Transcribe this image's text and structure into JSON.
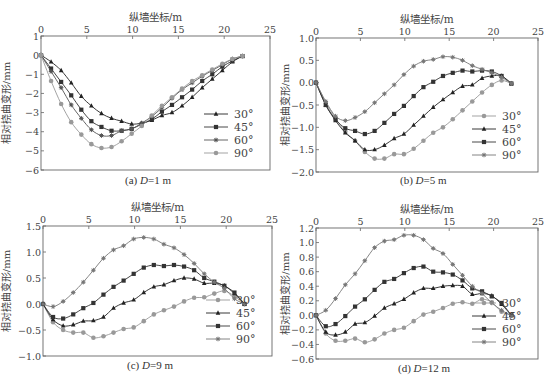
{
  "colors": {
    "s30_dark": "#222222",
    "s45_dark": "#333333",
    "s60_dark": "#444444",
    "s90_light": "#999999",
    "axis": "#555555"
  },
  "chart_data": [
    {
      "id": "a",
      "type": "line",
      "title": "(a) D=1 m",
      "caption_prefix": "(a) ",
      "caption_var": "D",
      "caption_suffix": "=1 m",
      "xlabel": "纵墙坐标/m",
      "ylabel": "相对挠曲变形/mm",
      "xlim": [
        0,
        25
      ],
      "ylim": [
        -6,
        1
      ],
      "xticks": [
        0,
        5,
        10,
        15,
        20,
        25
      ],
      "yticks": [
        1,
        0,
        -1,
        -2,
        -3,
        -4,
        -5,
        -6
      ],
      "ytick_labels": [
        "1",
        "0",
        "−1",
        "−2",
        "−3",
        "−4",
        "−5",
        "−6"
      ],
      "xaxis_position": "top",
      "grid": false,
      "legend_position": "lower right",
      "plot_box": {
        "left": 41,
        "top": 36,
        "right": 270,
        "bottom": 170
      },
      "x": [
        0,
        1.1,
        2.2,
        3.3,
        4.4,
        5.5,
        6.6,
        7.7,
        8.8,
        9.9,
        11,
        12.1,
        13.2,
        14.3,
        15.4,
        16.5,
        17.6,
        18.7,
        19.8,
        20.9,
        22
      ],
      "series": [
        {
          "name": "30°",
          "marker": "triangle",
          "color": "#222222",
          "values": [
            0,
            -0.35,
            -0.8,
            -1.45,
            -2.15,
            -2.65,
            -3.05,
            -3.3,
            -3.45,
            -3.6,
            -3.55,
            -3.4,
            -3.15,
            -3.0,
            -2.65,
            -2.2,
            -1.7,
            -1.25,
            -0.8,
            -0.35,
            -0.05
          ]
        },
        {
          "name": "45°",
          "marker": "square",
          "color": "#333333",
          "values": [
            0,
            -0.7,
            -1.4,
            -2.1,
            -2.85,
            -3.45,
            -3.75,
            -3.95,
            -3.95,
            -3.85,
            -3.6,
            -3.35,
            -2.95,
            -2.6,
            -2.2,
            -1.8,
            -1.35,
            -1.0,
            -0.6,
            -0.3,
            -0.05
          ]
        },
        {
          "name": "60°",
          "marker": "star",
          "color": "#555555",
          "values": [
            0,
            -0.85,
            -1.7,
            -2.6,
            -3.3,
            -3.9,
            -4.2,
            -4.2,
            -3.95,
            -3.85,
            -3.55,
            -3.2,
            -2.75,
            -2.25,
            -1.8,
            -1.45,
            -1.1,
            -0.8,
            -0.5,
            -0.2,
            -0.05
          ]
        },
        {
          "name": "90°",
          "marker": "circle",
          "color": "#999999",
          "values": [
            0,
            -1.35,
            -2.55,
            -3.5,
            -4.15,
            -4.65,
            -4.85,
            -4.8,
            -4.5,
            -4.1,
            -3.7,
            -3.15,
            -2.65,
            -2.2,
            -1.75,
            -1.35,
            -1.05,
            -0.75,
            -0.45,
            -0.2,
            -0.05
          ]
        }
      ]
    },
    {
      "id": "b",
      "type": "line",
      "title": "(b) D=5 m",
      "caption_prefix": "(b) ",
      "caption_var": "D",
      "caption_suffix": "=5 m",
      "xlabel": "纵墙坐标/m",
      "ylabel": "相对挠曲变形/mm",
      "xlim": [
        0,
        25
      ],
      "ylim": [
        -2.0,
        1.0
      ],
      "xticks": [
        0,
        5,
        10,
        15,
        20,
        25
      ],
      "yticks": [
        1.0,
        0.5,
        0.0,
        -0.5,
        -1.0,
        -1.5,
        -2.0
      ],
      "ytick_labels": [
        "1.0",
        "0.5",
        "0.0",
        "−0.5",
        "−1.0",
        "−1.5",
        "−2.0"
      ],
      "xaxis_position": "top",
      "grid": false,
      "legend_position": "lower right",
      "plot_box": {
        "left": 316,
        "top": 38,
        "right": 538,
        "bottom": 172
      },
      "x": [
        0,
        1.1,
        2.2,
        3.3,
        4.4,
        5.5,
        6.6,
        7.7,
        8.8,
        9.9,
        11,
        12.1,
        13.2,
        14.3,
        15.4,
        16.5,
        17.6,
        18.7,
        19.8,
        20.9,
        22
      ],
      "series": [
        {
          "name": "30°",
          "marker": "circle",
          "color": "#999999",
          "values": [
            0,
            -0.45,
            -0.8,
            -1.1,
            -1.3,
            -1.55,
            -1.7,
            -1.7,
            -1.6,
            -1.6,
            -1.48,
            -1.3,
            -1.12,
            -1.0,
            -0.82,
            -0.62,
            -0.42,
            -0.22,
            -0.05,
            0.05,
            -0.02
          ]
        },
        {
          "name": "45°",
          "marker": "triangle",
          "color": "#222222",
          "values": [
            0,
            -0.5,
            -0.85,
            -1.12,
            -1.3,
            -1.5,
            -1.5,
            -1.4,
            -1.25,
            -1.15,
            -0.95,
            -0.75,
            -0.55,
            -0.38,
            -0.22,
            -0.08,
            -0.05,
            0.1,
            0.15,
            0.15,
            -0.02
          ]
        },
        {
          "name": "60°",
          "marker": "square",
          "color": "#333333",
          "values": [
            0,
            -0.5,
            -0.82,
            -1.02,
            -1.08,
            -1.15,
            -1.08,
            -0.9,
            -0.7,
            -0.52,
            -0.3,
            -0.1,
            0.02,
            0.15,
            0.22,
            0.27,
            0.25,
            0.27,
            0.25,
            0.15,
            -0.02
          ]
        },
        {
          "name": "90°",
          "marker": "star",
          "color": "#777777",
          "values": [
            0,
            -0.42,
            -0.75,
            -0.85,
            -0.78,
            -0.65,
            -0.45,
            -0.25,
            -0.05,
            0.18,
            0.37,
            0.48,
            0.52,
            0.58,
            0.57,
            0.5,
            0.38,
            0.3,
            0.22,
            0.12,
            -0.02
          ]
        }
      ]
    },
    {
      "id": "c",
      "type": "line",
      "title": "(c) D=9 m",
      "caption_prefix": "(c) ",
      "caption_var": "D",
      "caption_suffix": "=9 m",
      "xlabel": "纵墙坐标/m",
      "ylabel": "相对挠曲变形/mm",
      "xlim": [
        0,
        25
      ],
      "ylim": [
        -1.0,
        1.5
      ],
      "xticks": [
        0,
        5,
        10,
        15,
        20,
        25
      ],
      "yticks": [
        1.5,
        1.0,
        0.5,
        0.0,
        -0.5,
        -1.0
      ],
      "ytick_labels": [
        "1.5",
        "1.0",
        "0.5",
        "0.0",
        "−0.5",
        "−1.0"
      ],
      "xaxis_position": "top",
      "grid": false,
      "legend_position": "lower right",
      "plot_box": {
        "left": 43,
        "top": 226,
        "right": 272,
        "bottom": 356
      },
      "x": [
        0,
        1.1,
        2.2,
        3.3,
        4.4,
        5.5,
        6.6,
        7.7,
        8.8,
        9.9,
        11,
        12.1,
        13.2,
        14.3,
        15.4,
        16.5,
        17.6,
        18.7,
        19.8,
        20.9,
        22
      ],
      "series": [
        {
          "name": "30°",
          "marker": "circle",
          "color": "#999999",
          "values": [
            0,
            -0.35,
            -0.5,
            -0.55,
            -0.55,
            -0.65,
            -0.62,
            -0.55,
            -0.48,
            -0.45,
            -0.33,
            -0.2,
            -0.12,
            -0.05,
            0.05,
            0.12,
            0.13,
            0.2,
            0.25,
            0.15,
            0
          ]
        },
        {
          "name": "45°",
          "marker": "triangle",
          "color": "#222222",
          "values": [
            0,
            -0.3,
            -0.42,
            -0.4,
            -0.33,
            -0.32,
            -0.25,
            -0.08,
            0.02,
            0.08,
            0.22,
            0.33,
            0.37,
            0.45,
            0.5,
            0.48,
            0.4,
            0.4,
            0.35,
            0.2,
            0
          ]
        },
        {
          "name": "60°",
          "marker": "square",
          "color": "#333333",
          "values": [
            0,
            -0.25,
            -0.28,
            -0.2,
            -0.08,
            0.02,
            0.18,
            0.33,
            0.45,
            0.58,
            0.7,
            0.75,
            0.73,
            0.75,
            0.72,
            0.65,
            0.5,
            0.43,
            0.35,
            0.22,
            0
          ]
        },
        {
          "name": "90°",
          "marker": "star",
          "color": "#777777",
          "values": [
            0,
            -0.05,
            0.05,
            0.22,
            0.42,
            0.65,
            0.88,
            1.04,
            1.12,
            1.25,
            1.28,
            1.25,
            1.15,
            1.08,
            0.95,
            0.78,
            0.58,
            0.42,
            0.3,
            0.1,
            0
          ]
        }
      ]
    },
    {
      "id": "d",
      "type": "line",
      "title": "(d) D=12 m",
      "caption_prefix": "(d) ",
      "caption_var": "D",
      "caption_suffix": "=12 m",
      "xlabel": "纵墙坐标/m",
      "ylabel": "相对挠曲变形/mm",
      "xlim": [
        0,
        25
      ],
      "ylim": [
        -0.6,
        1.2
      ],
      "xticks": [
        0,
        5,
        10,
        15,
        20,
        25
      ],
      "yticks": [
        1.2,
        1.0,
        0.8,
        0.6,
        0.4,
        0.2,
        0.0,
        -0.2,
        -0.4,
        -0.6
      ],
      "ytick_labels": [
        "1.2",
        "1.0",
        "0.8",
        "0.6",
        "0.4",
        "0.2",
        "0.0",
        "−0.2",
        "−0.4",
        "−0.6"
      ],
      "xaxis_position": "top",
      "grid": false,
      "legend_position": "lower right",
      "plot_box": {
        "left": 316,
        "top": 228,
        "right": 538,
        "bottom": 359
      },
      "x": [
        0,
        1.1,
        2.2,
        3.3,
        4.4,
        5.5,
        6.6,
        7.7,
        8.8,
        9.9,
        11,
        12.1,
        13.2,
        14.3,
        15.4,
        16.5,
        17.6,
        18.7,
        19.8,
        20.9,
        22
      ],
      "series": [
        {
          "name": "30°",
          "marker": "circle",
          "color": "#999999",
          "values": [
            0,
            -0.25,
            -0.35,
            -0.35,
            -0.32,
            -0.37,
            -0.33,
            -0.25,
            -0.2,
            -0.17,
            -0.08,
            0.01,
            0.05,
            0.1,
            0.16,
            0.18,
            0.16,
            0.22,
            0.18,
            0.05,
            0
          ]
        },
        {
          "name": "45°",
          "marker": "triangle",
          "color": "#222222",
          "values": [
            0,
            -0.23,
            -0.27,
            -0.23,
            -0.12,
            -0.1,
            -0.01,
            0.1,
            0.16,
            0.22,
            0.31,
            0.37,
            0.37,
            0.4,
            0.41,
            0.4,
            0.29,
            0.3,
            0.27,
            0.15,
            0
          ]
        },
        {
          "name": "60°",
          "marker": "square",
          "color": "#333333",
          "values": [
            0,
            -0.15,
            -0.12,
            -0.01,
            0.12,
            0.22,
            0.35,
            0.46,
            0.5,
            0.58,
            0.65,
            0.67,
            0.6,
            0.59,
            0.56,
            0.48,
            0.37,
            0.33,
            0.26,
            0.17,
            0
          ]
        },
        {
          "name": "90°",
          "marker": "star",
          "color": "#777777",
          "values": [
            0,
            0.07,
            0.23,
            0.42,
            0.57,
            0.75,
            0.93,
            1.02,
            1.04,
            1.1,
            1.1,
            1.04,
            0.92,
            0.85,
            0.7,
            0.55,
            0.4,
            0.3,
            0.17,
            0.07,
            0
          ]
        }
      ]
    }
  ]
}
